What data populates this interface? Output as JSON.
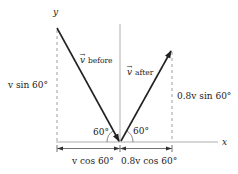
{
  "diagram": {
    "title": "",
    "axes": {
      "x_label": "x",
      "y_label": "y"
    },
    "vectors": {
      "before": {
        "symbol": "v⃗",
        "symbol_base": "v",
        "subscript": "before",
        "angle_label": "60°"
      },
      "after": {
        "symbol": "v⃗",
        "symbol_base": "v",
        "subscript": "after",
        "angle_label": "60°"
      }
    },
    "components": {
      "before_vertical": "v sin 60°",
      "after_vertical": "0.8v sin 60°",
      "before_horizontal": "v cos 60°",
      "after_horizontal": "0.8v cos 60°"
    },
    "colors": {
      "line": "#222222",
      "axis": "#999999",
      "dashed": "#888888"
    }
  }
}
